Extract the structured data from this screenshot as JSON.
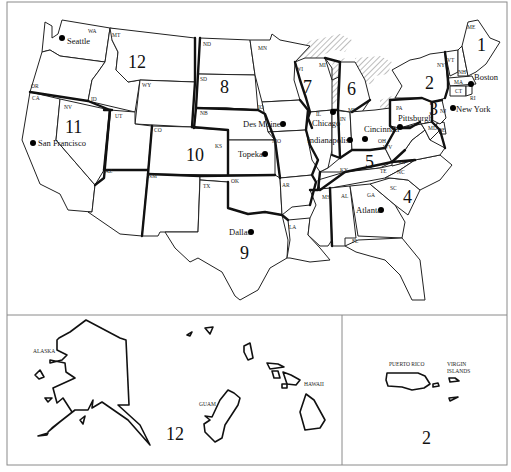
{
  "map": {
    "title": "Federal regions of the United States",
    "regions": [
      {
        "number": "1",
        "label": "1"
      },
      {
        "number": "2",
        "label": "2"
      },
      {
        "number": "3",
        "label": "3"
      },
      {
        "number": "4",
        "label": "4"
      },
      {
        "number": "5",
        "label": "5"
      },
      {
        "number": "6",
        "label": "6"
      },
      {
        "number": "7",
        "label": "7"
      },
      {
        "number": "8",
        "label": "8"
      },
      {
        "number": "9",
        "label": "9"
      },
      {
        "number": "10",
        "label": "10"
      },
      {
        "number": "11",
        "label": "11"
      },
      {
        "number": "12",
        "label": "12"
      }
    ],
    "states": {
      "WA": "WA",
      "OR": "OR",
      "CA": "CA",
      "NV": "NV",
      "ID": "ID",
      "MT": "MT",
      "WY": "WY",
      "UT": "UT",
      "AZ": "AZ",
      "CO": "CO",
      "NM": "NM",
      "ND": "ND",
      "SD": "SD",
      "NB": "NB",
      "KS": "KS",
      "OK": "OK",
      "TX": "TX",
      "MN": "MN",
      "IO": "IO",
      "MO": "MO",
      "AR": "AR",
      "LA": "LA",
      "WI": "WI",
      "IL": "IL",
      "MI_UP": "MI",
      "MI_LP": "MI",
      "IN": "IN",
      "OH": "OH",
      "KY": "KY",
      "TE": "TE",
      "MS": "MS",
      "AL": "AL",
      "GA": "GA",
      "FL": "FL",
      "SC": "SC",
      "NC": "NC",
      "VA": "VA",
      "WV": "WV",
      "PA": "PA",
      "MD": "MD",
      "DE": "DE",
      "NJ": "NJ",
      "NY": "NY",
      "VT": "VT",
      "NH": "NH",
      "MA": "MA",
      "CT": "CT",
      "RI": "RI",
      "ME": "ME"
    },
    "cities": {
      "seattle": "Seattle",
      "san_francisco": "San Francisco",
      "des_moines": "Des Moines",
      "topeka": "Topeka",
      "dallas": "Dallas",
      "chicago": "Chicago",
      "indianapolis": "Indianapolis",
      "cincinnati": "Cincinnati",
      "pittsburgh": "Pittsburgh",
      "atlanta": "Atlanta",
      "boston": "Boston",
      "new_york": "New York"
    },
    "insets": {
      "pacific": {
        "alaska": "ALASKA",
        "hawaii": "HAWAII",
        "guam": "GUAM",
        "region": "12"
      },
      "caribbean": {
        "puerto_rico": "PUERTO RICO",
        "virgin_islands_1": "VIRGIN",
        "virgin_islands_2": "ISLANDS",
        "region": "2"
      }
    }
  }
}
